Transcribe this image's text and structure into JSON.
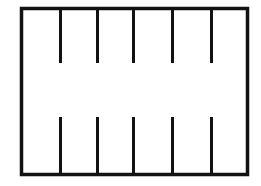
{
  "figure": {
    "background_color": "#ffffff",
    "stroke_color": "#121212",
    "canvas": {
      "width": 261,
      "height": 186
    },
    "rectangle": {
      "name": "outer-rectangle",
      "x": 21.5,
      "y": 8.5,
      "width": 226,
      "height": 166,
      "stroke_width": 3.5,
      "fill": "none"
    },
    "top_ticks": {
      "name": "top-tick-group",
      "count": 6,
      "stroke_width": 3,
      "y_start": 8,
      "y_end": 63,
      "length": 55,
      "x_positions": [
        60.5,
        97.5,
        133.5,
        172.5,
        211.5,
        247.5
      ]
    },
    "bottom_ticks": {
      "name": "bottom-tick-group",
      "count": 6,
      "stroke_width": 3,
      "y_start": 117,
      "y_end": 175,
      "length": 58,
      "x_positions": [
        21.5,
        60.5,
        97.5,
        133.5,
        172.5,
        211.5
      ]
    }
  }
}
